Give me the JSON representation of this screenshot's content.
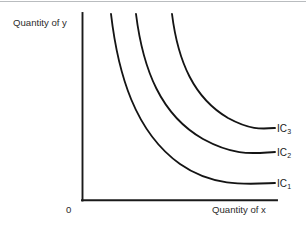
{
  "figure": {
    "background_color": "#ffffff",
    "ink_color": "#141414",
    "top_rule_color": "#b9bcbf",
    "axis": {
      "y_label": "Quantity of y",
      "x_label": "Quantity of x",
      "origin_label": "0"
    },
    "curve_labels": {
      "ic1_base": "IC",
      "ic1_sub": "1",
      "ic2_base": "IC",
      "ic2_sub": "2",
      "ic3_base": "IC",
      "ic3_sub": "3"
    }
  },
  "chart_data": {
    "type": "line",
    "title": "",
    "subtitle": "",
    "xlabel": "Quantity of x",
    "ylabel": "Quantity of y",
    "origin_label": "0",
    "grid": false,
    "legend": "inline-right-end-labels",
    "axis_style": "open (left spine and bottom spine only, no ticks, no numeric scale)",
    "xlim": [
      0,
      1
    ],
    "ylim": [
      0,
      1
    ],
    "axis_pixels": {
      "y_axis_x": 82,
      "y_axis_top_y": 13,
      "x_axis_y": 200,
      "x_axis_right_x": 277
    },
    "series": [
      {
        "name": "IC1",
        "label": "IC₁",
        "description": "lowest indifference curve, convex to the origin",
        "path_pixels": "M 111,14 C 118,74 135,132 180,164 C 214,188 250,184 275,183",
        "start_point": [
          111,
          14
        ],
        "end_point": [
          275,
          183
        ]
      },
      {
        "name": "IC2",
        "label": "IC₂",
        "description": "middle indifference curve, higher utility than IC1",
        "path_pixels": "M 136,14 C 143,70 161,115 203,139 C 236,157 254,153 275,152",
        "start_point": [
          136,
          14
        ],
        "end_point": [
          275,
          152
        ]
      },
      {
        "name": "IC3",
        "label": "IC₃",
        "description": "highest indifference curve, greatest utility",
        "path_pixels": "M 172,14 C 178,62 194,98 228,118 C 250,130 261,129 275,128",
        "start_point": [
          172,
          14
        ],
        "end_point": [
          275,
          128
        ]
      }
    ],
    "annotations": [
      {
        "text": "IC₁",
        "at_pixels": [
          277,
          179
        ]
      },
      {
        "text": "IC₂",
        "at_pixels": [
          277,
          148
        ]
      },
      {
        "text": "IC₃",
        "at_pixels": [
          277,
          124
        ]
      }
    ]
  }
}
